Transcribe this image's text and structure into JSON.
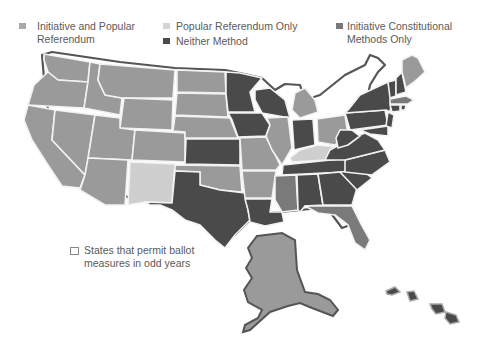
{
  "legend": {
    "items": [
      {
        "label": "Initiative and Popular\nReferendum",
        "color": "#9a9a9a"
      },
      {
        "label": "Popular Referendum Only",
        "color": "#cfcfcf"
      },
      {
        "label": "Neither Method",
        "color": "#4a4a4a"
      },
      {
        "label": "Initiative Constitutional\nMethods Only",
        "color": "#7a7a7a"
      }
    ],
    "odd_years_note": "States that permit ballot\nmeasures in odd years"
  },
  "colors": {
    "initiative_and_referendum": "#9a9a9a",
    "referendum_only": "#cfcfcf",
    "neither": "#4a4a4a",
    "constitutional_only": "#7a7a7a",
    "state_border": "#f2f2f2",
    "coast_outline": "#555555"
  }
}
